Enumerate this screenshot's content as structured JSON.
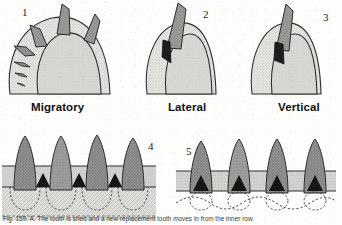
{
  "figure": {
    "width": 342,
    "height": 225,
    "caption": "Fig. 159. A. The tooth is  shed and a new replacement tooth moves in from the  inner  row.",
    "caption_visible_fragment": "Fig. 159. A. The tooth is shed and a new tooth moves in",
    "background_color": "#fdfdfc"
  },
  "colors": {
    "tooth_gray": "#8d8d8d",
    "tooth_gray_light": "#a6a6a6",
    "jaw_fill": "#d8d8d4",
    "jaw_stipple": "#c9c9c4",
    "band_fill": "#cfcfcb",
    "replacement_dark": "#1f1f1f",
    "outline": "#2a2a2a",
    "label_text": "#111111",
    "number_text": "#1b1b1b"
  },
  "panels": [
    {
      "id": "panel-1",
      "number": "1",
      "mode_label": "Migratory",
      "description": "Dome-shaped jaw in cross section with teeth emerging at progressively rotated angles around the margin",
      "tooth_count": 7,
      "number_position": {
        "x": 22,
        "y": 8
      },
      "label_position": {
        "x": 31,
        "y": 101
      }
    },
    {
      "id": "panel-2",
      "number": "2",
      "mode_label": "Lateral",
      "description": "Jaw tip with a single functional tooth and one dark replacement tooth positioned laterally against it",
      "tooth_count": 1,
      "replacement_count": 1,
      "number_position": {
        "x": 203,
        "y": 10
      },
      "label_position": {
        "x": 168,
        "y": 101
      }
    },
    {
      "id": "panel-3",
      "number": "3",
      "mode_label": "Vertical",
      "description": "Jaw tip with a functional tooth and a dark replacement tooth rising vertically beneath it",
      "tooth_count": 1,
      "replacement_count": 1,
      "number_position": {
        "x": 323,
        "y": 13
      },
      "label_position": {
        "x": 278,
        "y": 101
      }
    },
    {
      "id": "panel-4",
      "number": "4",
      "mode_label": "",
      "description": "Tooth row in lateral section: four functional teeth set in a hatched bone band, dark replacement teeth in the interdental gaps, dashed crypt outlines below",
      "tooth_count": 4,
      "replacement_count": 3,
      "number_position": {
        "x": 148,
        "y": 143
      }
    },
    {
      "id": "panel-5",
      "number": "5",
      "mode_label": "",
      "description": "Tooth row in lateral section: four functional teeth each with a dark replacement tooth directly at its base, dashed crypt outlines below",
      "tooth_count": 4,
      "replacement_count": 4,
      "number_position": {
        "x": 186,
        "y": 148
      }
    }
  ]
}
